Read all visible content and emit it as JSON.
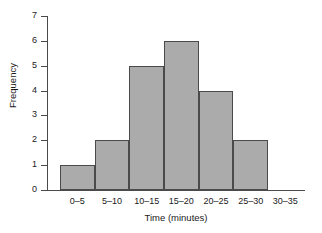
{
  "chart_data": {
    "type": "bar",
    "title": "",
    "subtitle": "",
    "xlabel": "Time (minutes)",
    "ylabel": "Frequency",
    "categories": [
      "0–5",
      "5–10",
      "10–15",
      "15–20",
      "20–25",
      "25–30",
      "30–35"
    ],
    "values": [
      1,
      2,
      5,
      6,
      4,
      2,
      0
    ],
    "ylim": [
      0,
      7
    ],
    "yticks": [
      0,
      1,
      2,
      3,
      4,
      5,
      6,
      7
    ],
    "ytick_labels": [
      "0",
      "1",
      "2",
      "3",
      "4",
      "5",
      "6",
      "7"
    ],
    "grid": false,
    "legend": null,
    "annotations": [],
    "bar_fill_color": "#ababab",
    "bar_edge_color": "#4a4a4a",
    "axis_color": "#4a4a4a",
    "background_color": "#ffffff"
  }
}
